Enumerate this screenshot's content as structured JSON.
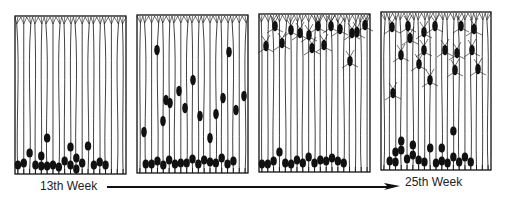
{
  "figure": {
    "panels": [
      {
        "id": "panel-1",
        "x": 15,
        "y": 16,
        "w": 111,
        "h": 158,
        "fibers": 19,
        "migrating": [],
        "somas": [
          {
            "f": 0,
            "y": 165
          },
          {
            "f": 1,
            "y": 163
          },
          {
            "f": 2,
            "y": 153
          },
          {
            "f": 3,
            "y": 165
          },
          {
            "f": 4,
            "y": 156
          },
          {
            "f": 4,
            "y": 166
          },
          {
            "f": 5,
            "y": 138
          },
          {
            "f": 5,
            "y": 166
          },
          {
            "f": 6,
            "y": 165
          },
          {
            "f": 7,
            "y": 167
          },
          {
            "f": 8,
            "y": 161
          },
          {
            "f": 9,
            "y": 147
          },
          {
            "f": 9,
            "y": 165
          },
          {
            "f": 10,
            "y": 158
          },
          {
            "f": 10,
            "y": 169
          },
          {
            "f": 11,
            "y": 163
          },
          {
            "f": 12,
            "y": 146
          },
          {
            "f": 13,
            "y": 165
          },
          {
            "f": 14,
            "y": 162
          },
          {
            "f": 15,
            "y": 165
          }
        ]
      },
      {
        "id": "panel-2",
        "x": 137,
        "y": 15,
        "w": 111,
        "h": 158,
        "fibers": 19,
        "migrating": [
          {
            "x": 157,
            "y": 50
          },
          {
            "x": 166,
            "y": 100
          },
          {
            "x": 163,
            "y": 121
          },
          {
            "x": 170,
            "y": 103
          },
          {
            "x": 179,
            "y": 91
          },
          {
            "x": 193,
            "y": 80
          },
          {
            "x": 185,
            "y": 108
          },
          {
            "x": 200,
            "y": 116
          },
          {
            "x": 210,
            "y": 138
          },
          {
            "x": 216,
            "y": 114
          },
          {
            "x": 223,
            "y": 98
          },
          {
            "x": 229,
            "y": 52
          },
          {
            "x": 236,
            "y": 110
          },
          {
            "x": 244,
            "y": 96
          },
          {
            "x": 144,
            "y": 132
          }
        ],
        "somas": [
          {
            "f": 1,
            "y": 164
          },
          {
            "f": 2,
            "y": 164
          },
          {
            "f": 3,
            "y": 161
          },
          {
            "f": 4,
            "y": 165
          },
          {
            "f": 5,
            "y": 160
          },
          {
            "f": 6,
            "y": 164
          },
          {
            "f": 7,
            "y": 163
          },
          {
            "f": 8,
            "y": 163
          },
          {
            "f": 9,
            "y": 159
          },
          {
            "f": 10,
            "y": 164
          },
          {
            "f": 11,
            "y": 160
          },
          {
            "f": 12,
            "y": 162
          },
          {
            "f": 13,
            "y": 163
          },
          {
            "f": 14,
            "y": 158
          },
          {
            "f": 15,
            "y": 164
          },
          {
            "f": 16,
            "y": 161
          }
        ]
      },
      {
        "id": "panel-3",
        "x": 259,
        "y": 14,
        "w": 111,
        "h": 158,
        "fibers": 19,
        "migrating": [
          {
            "x": 266,
            "y": 46
          },
          {
            "x": 282,
            "y": 43
          },
          {
            "x": 291,
            "y": 30
          },
          {
            "x": 300,
            "y": 33
          },
          {
            "x": 309,
            "y": 35
          },
          {
            "x": 312,
            "y": 48
          },
          {
            "x": 318,
            "y": 26
          },
          {
            "x": 324,
            "y": 45
          },
          {
            "x": 331,
            "y": 26
          },
          {
            "x": 350,
            "y": 61
          },
          {
            "x": 352,
            "y": 33
          },
          {
            "x": 365,
            "y": 25
          },
          {
            "x": 357,
            "y": 32
          },
          {
            "x": 340,
            "y": 29
          },
          {
            "x": 275,
            "y": 26
          }
        ],
        "somas": [
          {
            "f": 0,
            "y": 164
          },
          {
            "f": 1,
            "y": 164
          },
          {
            "f": 2,
            "y": 161
          },
          {
            "f": 3,
            "y": 152
          },
          {
            "f": 4,
            "y": 163
          },
          {
            "f": 5,
            "y": 164
          },
          {
            "f": 6,
            "y": 160
          },
          {
            "f": 7,
            "y": 163
          },
          {
            "f": 8,
            "y": 157
          },
          {
            "f": 9,
            "y": 163
          },
          {
            "f": 10,
            "y": 160
          },
          {
            "f": 11,
            "y": 161
          },
          {
            "f": 12,
            "y": 158
          },
          {
            "f": 13,
            "y": 161
          },
          {
            "f": 14,
            "y": 163
          }
        ]
      },
      {
        "id": "panel-4",
        "x": 381,
        "y": 12,
        "w": 110,
        "h": 158,
        "fibers": 19,
        "migrating": [
          {
            "x": 393,
            "y": 93
          },
          {
            "x": 392,
            "y": 27
          },
          {
            "x": 401,
            "y": 55
          },
          {
            "x": 410,
            "y": 38
          },
          {
            "x": 408,
            "y": 26
          },
          {
            "x": 419,
            "y": 64
          },
          {
            "x": 424,
            "y": 32
          },
          {
            "x": 424,
            "y": 50
          },
          {
            "x": 430,
            "y": 80
          },
          {
            "x": 435,
            "y": 26
          },
          {
            "x": 457,
            "y": 53
          },
          {
            "x": 455,
            "y": 70
          },
          {
            "x": 461,
            "y": 26
          },
          {
            "x": 472,
            "y": 50
          },
          {
            "x": 474,
            "y": 29
          },
          {
            "x": 478,
            "y": 69
          },
          {
            "x": 445,
            "y": 50
          }
        ],
        "somas": [
          {
            "f": 1,
            "y": 161
          },
          {
            "f": 2,
            "y": 162
          },
          {
            "f": 2,
            "y": 152
          },
          {
            "f": 3,
            "y": 150
          },
          {
            "f": 4,
            "y": 159
          },
          {
            "f": 5,
            "y": 145
          },
          {
            "f": 5,
            "y": 155
          },
          {
            "f": 6,
            "y": 160
          },
          {
            "f": 7,
            "y": 162
          },
          {
            "f": 8,
            "y": 148
          },
          {
            "f": 9,
            "y": 163
          },
          {
            "f": 10,
            "y": 161
          },
          {
            "f": 10,
            "y": 148
          },
          {
            "f": 11,
            "y": 163
          },
          {
            "f": 12,
            "y": 131
          },
          {
            "f": 12,
            "y": 157
          },
          {
            "f": 13,
            "y": 162
          },
          {
            "f": 14,
            "y": 157
          },
          {
            "f": 15,
            "y": 162
          },
          {
            "f": 3,
            "y": 141
          }
        ]
      }
    ],
    "timeline": {
      "start_label": "13th Week",
      "end_label": "25th Week",
      "arrow": {
        "x1": 107,
        "x2": 400,
        "y": 187
      }
    },
    "colors": {
      "ink": "#111111",
      "background": "#ffffff"
    }
  }
}
